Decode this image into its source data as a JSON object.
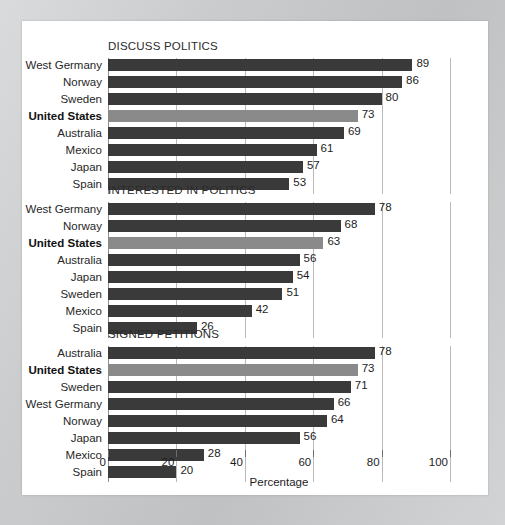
{
  "chart_data": {
    "type": "bar",
    "orientation": "horizontal",
    "title": "",
    "xlabel": "Percentage",
    "ylabel": "",
    "xlim": [
      0,
      100
    ],
    "xticks": [
      0,
      20,
      40,
      60,
      80,
      100
    ],
    "grid": true,
    "legend": "none",
    "highlight_category": "United States",
    "panels": [
      {
        "title": "DISCUSS POLITICS",
        "categories": [
          "West Germany",
          "Norway",
          "Sweden",
          "United States",
          "Australia",
          "Mexico",
          "Japan",
          "Spain"
        ],
        "values": [
          89,
          86,
          80,
          73,
          69,
          61,
          57,
          53
        ],
        "highlight": [
          false,
          false,
          false,
          true,
          false,
          false,
          false,
          false
        ]
      },
      {
        "title": "INTERESTED IN POLITICS",
        "categories": [
          "West Germany",
          "Norway",
          "United States",
          "Australia",
          "Japan",
          "Sweden",
          "Mexico",
          "Spain"
        ],
        "values": [
          78,
          68,
          63,
          56,
          54,
          51,
          42,
          26
        ],
        "highlight": [
          false,
          false,
          true,
          false,
          false,
          false,
          false,
          false
        ]
      },
      {
        "title": "SIGNED PETITIONS",
        "categories": [
          "Australia",
          "United States",
          "Sweden",
          "West Germany",
          "Norway",
          "Japan",
          "Mexico",
          "Spain"
        ],
        "values": [
          78,
          73,
          71,
          66,
          64,
          56,
          28,
          20
        ],
        "highlight": [
          false,
          true,
          false,
          false,
          false,
          false,
          false,
          false
        ]
      }
    ]
  },
  "colors": {
    "bar": "#3a3a3a",
    "bar_highlight": "#8a8a8a",
    "gridline": "#b9b9b9",
    "card": "#ffffff",
    "page_background": "#c9cbcd",
    "text": "#1d1d1d"
  }
}
